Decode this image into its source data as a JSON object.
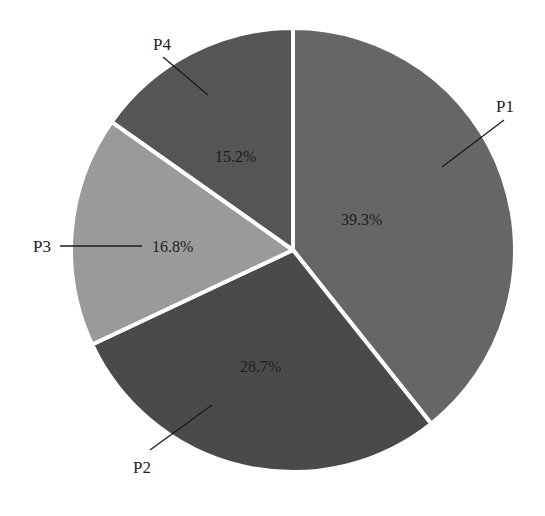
{
  "chart_data": {
    "type": "pie",
    "title": "",
    "categories": [
      "P1",
      "P2",
      "P3",
      "P4"
    ],
    "values": [
      39.3,
      28.7,
      16.8,
      15.2
    ],
    "value_labels": [
      "39.3%",
      "28.7%",
      "16.8%",
      "15.2%"
    ],
    "colors": [
      "#666666",
      "#4a4a4a",
      "#9a9a9a",
      "#555555"
    ],
    "start_angle_deg": 0,
    "direction": "clockwise",
    "legend": "none",
    "slice_separator_color": "#ffffff"
  },
  "labels": {
    "p1": "P1",
    "p2": "P2",
    "p3": "P3",
    "p4": "P4",
    "p1_pct": "39.3%",
    "p2_pct": "28.7%",
    "p3_pct": "16.8%",
    "p4_pct": "15.2%"
  }
}
